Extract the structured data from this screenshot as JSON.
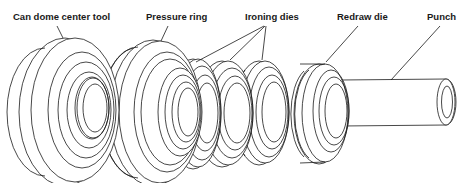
{
  "figure": {
    "colors": {
      "line": "#1a1a1a",
      "background": "#ffffff"
    },
    "labels": [
      {
        "id": "can-dome-center-tool",
        "text": "Can dome center tool"
      },
      {
        "id": "pressure-ring",
        "text": "Pressure ring"
      },
      {
        "id": "ironing-dies",
        "text": "Ironing dies"
      },
      {
        "id": "redraw-die",
        "text": "Redraw die"
      },
      {
        "id": "punch",
        "text": "Punch"
      }
    ]
  }
}
